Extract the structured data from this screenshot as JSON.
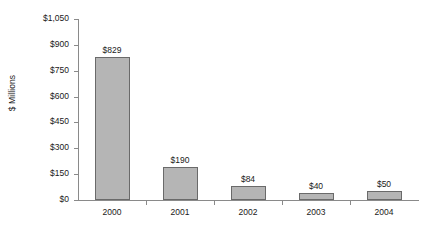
{
  "chart_data": {
    "type": "bar",
    "title": "",
    "subtitle": "",
    "xlabel": "",
    "ylabel": "$ Millions",
    "categories": [
      "2000",
      "2001",
      "2002",
      "2003",
      "2004"
    ],
    "values": [
      829,
      190,
      84,
      40,
      50
    ],
    "value_labels": [
      "$829",
      "$190",
      "$84",
      "$40",
      "$50"
    ],
    "ylim": [
      0,
      1050
    ],
    "ytick_values": [
      0,
      150,
      300,
      450,
      600,
      750,
      900,
      1050
    ],
    "ytick_labels": [
      "$0",
      "$150",
      "$300",
      "$450",
      "$600",
      "$750",
      "$900",
      "$1,050"
    ],
    "grid": false,
    "legend": null,
    "series": [
      {
        "name": "",
        "values": [
          829,
          190,
          84,
          40,
          50
        ],
        "bar_fill_color": "#b5b5b5",
        "bar_border_color": "#6a6a6a"
      }
    ],
    "annotations": [],
    "background_color": "#ffffff",
    "axis_color": "#8a8a8a",
    "text_color": "#1a1a1a"
  }
}
